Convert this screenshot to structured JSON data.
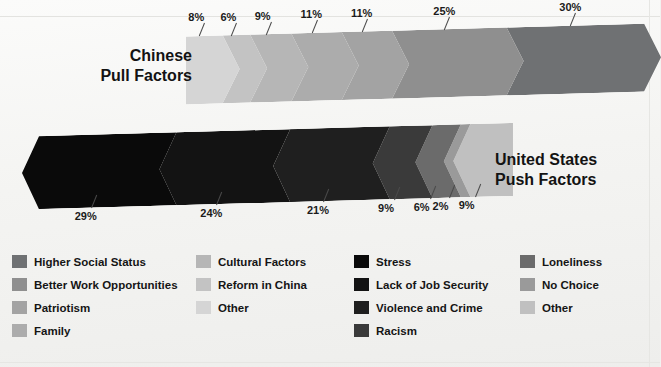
{
  "chart_data": {
    "type": "bar",
    "title": "",
    "subtitle": "",
    "xlabel": "",
    "ylabel": "",
    "grid": false,
    "legend_position": "bottom",
    "series": [
      {
        "name": "Chinese Pull Factors",
        "direction": "right",
        "categories": [
          "Other",
          "Reform in China",
          "Cultural Factors",
          "Family",
          "Patriotism",
          "Better Work Opportunities",
          "Higher Social Status"
        ],
        "values": [
          8,
          6,
          9,
          11,
          11,
          25,
          30
        ],
        "labels": [
          "8%",
          "6%",
          "9%",
          "11%",
          "11%",
          "25%",
          "30%"
        ],
        "colors": [
          "#d5d5d5",
          "#c3c3c3",
          "#b6b6b6",
          "#acacac",
          "#a3a3a3",
          "#8f8f8f",
          "#6f7173"
        ]
      },
      {
        "name": "United States Push Factors",
        "direction": "left",
        "categories": [
          "Stress",
          "Lack of Job Security",
          "Violence and Crime",
          "Racism",
          "Loneliness",
          "No Choice",
          "Other"
        ],
        "values": [
          29,
          24,
          21,
          9,
          6,
          2,
          9
        ],
        "labels": [
          "29%",
          "24%",
          "21%",
          "9%",
          "6%",
          "2%",
          "9%"
        ],
        "colors": [
          "#0a0a0a",
          "#131313",
          "#1f1f1f",
          "#3a3a3a",
          "#6b6b6b",
          "#9a9a9a",
          "#c0c0c0"
        ]
      }
    ]
  },
  "titles": {
    "chinese": "Chinese\nPull Factors",
    "united_states": "United States\nPush Factors"
  },
  "legend": {
    "columns": [
      {
        "items": [
          {
            "label": "Higher Social Status",
            "color": "#6f7173"
          },
          {
            "label": "Better Work Opportunities",
            "color": "#8f8f8f"
          },
          {
            "label": "Patriotism",
            "color": "#a3a3a3"
          },
          {
            "label": "Family",
            "color": "#acacac"
          }
        ]
      },
      {
        "items": [
          {
            "label": "Cultural Factors",
            "color": "#b6b6b6"
          },
          {
            "label": "Reform in China",
            "color": "#c3c3c3"
          },
          {
            "label": "Other",
            "color": "#d5d5d5"
          }
        ]
      },
      {
        "items": [
          {
            "label": "Stress",
            "color": "#0a0a0a"
          },
          {
            "label": "Lack of Job Security",
            "color": "#131313"
          },
          {
            "label": "Violence and Crime",
            "color": "#1f1f1f"
          },
          {
            "label": "Racism",
            "color": "#3a3a3a"
          }
        ]
      },
      {
        "items": [
          {
            "label": "Loneliness",
            "color": "#6b6b6b"
          },
          {
            "label": "No Choice",
            "color": "#9a9a9a"
          },
          {
            "label": "Other",
            "color": "#c0c0c0"
          }
        ]
      }
    ]
  }
}
